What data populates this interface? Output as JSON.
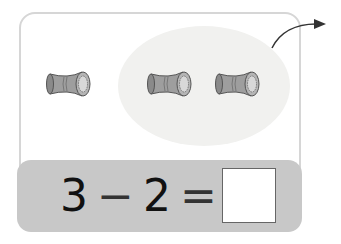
{
  "illustration": {
    "objects_total": 3,
    "objects_circled": 2,
    "object_type": "spool",
    "arrow": "take-away-arrow"
  },
  "equation": {
    "operand1": "3",
    "operator": "−",
    "operand2": "2",
    "equals": "=",
    "answer": ""
  },
  "colors": {
    "bar": "#c8c8c8",
    "ellipse": "#f1f1ef",
    "spool": "#9e9e9e"
  }
}
